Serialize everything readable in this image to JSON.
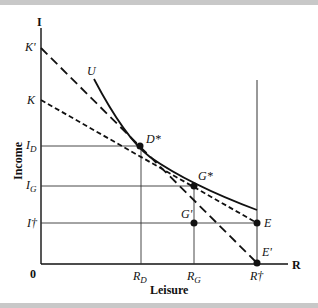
{
  "diagram": {
    "type": "income-leisure budget constraint",
    "axes": {
      "y_symbol": "I",
      "x_symbol": "R",
      "y_label": "Income",
      "x_label": "Leisure",
      "origin": "0"
    },
    "y_ticks": [
      "K'",
      "K",
      "I_D",
      "I_G",
      "I†"
    ],
    "y_tick_display": {
      "Kp": "K'",
      "K": "K",
      "ID_main": "I",
      "ID_sub": "D",
      "IG_main": "I",
      "IG_sub": "G",
      "Idag": "I†"
    },
    "x_tick_display": {
      "RD_main": "R",
      "RD_sub": "D",
      "RG_main": "R",
      "RG_sub": "G",
      "Rdag": "R†"
    },
    "points": {
      "D_star": "D*",
      "G_star": "G*",
      "G_prime": "G'",
      "E": "E",
      "E_prime": "E'"
    },
    "curve_label": "U",
    "lines": [
      {
        "name": "budget line K'-E'",
        "style": "long-dash"
      },
      {
        "name": "budget line K-E",
        "style": "short-dash"
      },
      {
        "name": "indifference curve U",
        "style": "solid"
      }
    ]
  }
}
